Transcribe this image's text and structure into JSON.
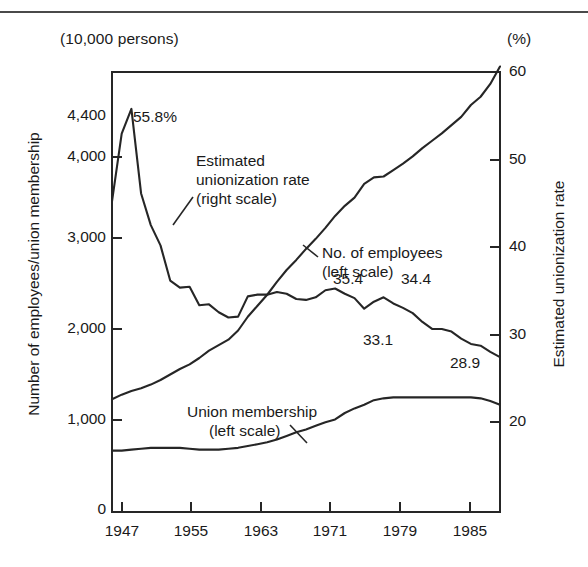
{
  "chart_data": {
    "type": "line",
    "title": "",
    "subtitle": "",
    "unit_left": "(10,000 persons)",
    "unit_right": "(%)",
    "ylabel_left": "Number of employees/union membership",
    "ylabel_right": "Estimated unionization rate",
    "xlabel": "",
    "grid": false,
    "legend_position": "inline-annotations",
    "x": [
      1947,
      1948,
      1949,
      1950,
      1951,
      1952,
      1953,
      1954,
      1955,
      1956,
      1957,
      1958,
      1959,
      1960,
      1961,
      1962,
      1963,
      1964,
      1965,
      1966,
      1967,
      1968,
      1969,
      1970,
      1971,
      1972,
      1973,
      1974,
      1975,
      1976,
      1977,
      1978,
      1979,
      1980,
      1981,
      1982,
      1983,
      1984,
      1985,
      1986,
      1987
    ],
    "xticks": [
      1947,
      1955,
      1963,
      1971,
      1979,
      1985
    ],
    "xlim": [
      1947,
      1987
    ],
    "ylim_left": [
      0,
      4800
    ],
    "yticks_left": [
      "0",
      "1,000",
      "2,000",
      "3,000",
      "4,000",
      "4,400"
    ],
    "ytick_values_left": [
      0,
      1000,
      2000,
      3000,
      4000,
      4400
    ],
    "ylim_right": [
      10,
      60
    ],
    "yticks_right": [
      "20",
      "30",
      "40",
      "50",
      "60"
    ],
    "ytick_values_right": [
      20,
      30,
      40,
      50,
      60
    ],
    "series": [
      {
        "name": "No. of employees (left scale)",
        "axis": "left",
        "values": [
          1230,
          1280,
          1320,
          1350,
          1390,
          1440,
          1500,
          1560,
          1610,
          1680,
          1760,
          1820,
          1880,
          1980,
          2130,
          2250,
          2370,
          2510,
          2640,
          2750,
          2870,
          2980,
          3100,
          3230,
          3340,
          3430,
          3580,
          3650,
          3660,
          3730,
          3800,
          3880,
          3970,
          4050,
          4130,
          4220,
          4310,
          4440,
          4530,
          4670,
          4860
        ]
      },
      {
        "name": "Union membership (left scale)",
        "axis": "left",
        "values": [
          670,
          670,
          680,
          690,
          700,
          700,
          700,
          700,
          690,
          680,
          680,
          680,
          690,
          700,
          720,
          740,
          760,
          790,
          830,
          870,
          900,
          940,
          980,
          1010,
          1080,
          1130,
          1170,
          1220,
          1240,
          1250,
          1250,
          1250,
          1250,
          1250,
          1250,
          1250,
          1250,
          1250,
          1240,
          1210,
          1170
        ]
      },
      {
        "name": "Estimated unionization rate (right scale)",
        "axis": "right",
        "values": [
          45.3,
          53.0,
          55.8,
          46.2,
          42.6,
          40.3,
          36.3,
          35.5,
          35.6,
          33.5,
          33.6,
          32.7,
          32.1,
          32.2,
          34.5,
          34.7,
          34.7,
          35.0,
          34.8,
          34.2,
          34.1,
          34.4,
          35.2,
          35.4,
          34.8,
          34.3,
          33.1,
          33.9,
          34.4,
          33.7,
          33.2,
          32.6,
          31.6,
          30.8,
          30.8,
          30.5,
          29.7,
          29.1,
          28.9,
          28.2,
          27.6
        ]
      }
    ],
    "annotations": [
      {
        "id": "peak-label",
        "text": "55.8%",
        "x": 133,
        "y": 108
      },
      {
        "id": "rate-callout",
        "text": "Estimated\nunionization rate\n(right scale)",
        "x": 196,
        "y": 151
      },
      {
        "id": "employees-callout",
        "text": "No. of employees\n(left scale)",
        "x": 322,
        "y": 251
      },
      {
        "id": "membership-callout",
        "text": "Union membership\n(left scale)",
        "x": 187,
        "y": 410
      },
      {
        "id": "value-35-4",
        "text": "35.4",
        "x": 333,
        "y": 272
      },
      {
        "id": "value-34-4",
        "text": "34.4",
        "x": 401,
        "y": 272
      },
      {
        "id": "value-33-1",
        "text": "33.1",
        "x": 363,
        "y": 333
      },
      {
        "id": "value-28-9",
        "text": "28.9",
        "x": 450,
        "y": 356
      }
    ],
    "colors": {
      "line": "#262626",
      "axis": "#262626",
      "background": "#ffffff",
      "text": "#1a1a1a"
    }
  },
  "annotation_text": {
    "peak": "55.8%",
    "rate_l1": "Estimated",
    "rate_l2": "unionization rate",
    "rate_l3": "(right scale)",
    "emp_l1": "No. of employees",
    "emp_l2": "(left scale)",
    "mem_l1": "Union membership",
    "mem_l2": "(left scale)",
    "v354": "35.4",
    "v344": "34.4",
    "v331": "33.1",
    "v289": "28.9"
  }
}
